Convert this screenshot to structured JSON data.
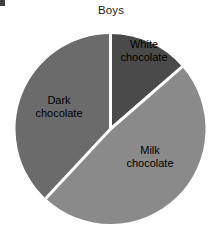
{
  "chart_data": {
    "type": "pie",
    "title": "Boys",
    "xlabel": "",
    "ylabel": "",
    "legend_position": "none",
    "grid": false,
    "labels_on_slices": true,
    "categories": [
      "White chocolate",
      "Milk chocolate",
      "Dark chocolate"
    ],
    "values": [
      13.6,
      48.3,
      38.1
    ],
    "value_unit": "percent",
    "start_angle_deg": 0,
    "direction": "clockwise",
    "slices": [
      {
        "label": "White chocolate",
        "label_line_1": "White",
        "label_line_2": "chocolate",
        "value": 13.6,
        "angle_deg": 49,
        "start_deg": 0,
        "end_deg": 49,
        "color": "#4a4a4a"
      },
      {
        "label": "Milk chocolate",
        "label_line_1": "Milk",
        "label_line_2": "chocolate",
        "value": 48.3,
        "angle_deg": 174,
        "start_deg": 49,
        "end_deg": 223,
        "color": "#8a8a8a"
      },
      {
        "label": "Dark chocolate",
        "label_line_1": "Dark",
        "label_line_2": "chocolate",
        "value": 38.1,
        "angle_deg": 137,
        "start_deg": 223,
        "end_deg": 360,
        "color": "#6b6b6b"
      }
    ],
    "separator_color": "#ffffff",
    "background_color": "#ffffff",
    "text_color": "#000000"
  }
}
